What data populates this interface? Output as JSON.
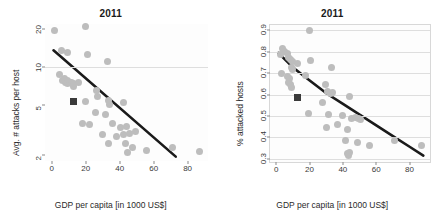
{
  "figure": {
    "panels": [
      {
        "name": "avg-attacks-per-host",
        "title": "2011",
        "xlabel": "GDP per capita [in 1000 US$]",
        "ylabel": "Avg. # attacks per host",
        "xticks": [
          "0",
          "20",
          "40",
          "60",
          "80"
        ],
        "yticks": [
          "2",
          "5",
          "10",
          "20"
        ]
      },
      {
        "name": "percent-attacked-hosts",
        "title": "2011",
        "xlabel": "GDP per capita [in 1000 US$]",
        "ylabel": "% attacked hosts",
        "xticks": [
          "0",
          "20",
          "40",
          "60",
          "80"
        ],
        "yticks": [
          "0.3",
          "0.4",
          "0.5",
          "0.6",
          "0.7",
          "0.8",
          "0.9"
        ]
      }
    ],
    "colors": {
      "point": "#bdbdbd",
      "highlight_marker": "#3a3a3a",
      "trend_line": "#1a1a1a",
      "gridline": "#dedede",
      "frame": "#d8d8d8",
      "background": "#ffffff"
    }
  },
  "chart_data": [
    {
      "type": "scatter",
      "title": "2011",
      "xlabel": "GDP per capita [in 1000 US$]",
      "ylabel": "Avg. # attacks per host",
      "xlim": [
        -4,
        92
      ],
      "ylim": [
        1.8,
        22
      ],
      "yscale": "log",
      "xscale": "linear",
      "xticks": [
        0,
        20,
        40,
        60,
        80
      ],
      "yticks": [
        2,
        5,
        10,
        20
      ],
      "grid": "horizontal-at-10",
      "gridlines_y": [
        10
      ],
      "legend": "none",
      "series": [
        {
          "name": "countries",
          "marker": "circle",
          "color": "#bdbdbd",
          "points": [
            [
              1.5,
              19.6
            ],
            [
              6.0,
              13.5
            ],
            [
              9.0,
              13.0
            ],
            [
              20.0,
              21.0
            ],
            [
              21.0,
              12.6
            ],
            [
              33.0,
              11.0
            ],
            [
              4.5,
              8.8
            ],
            [
              6.5,
              7.8
            ],
            [
              7.5,
              8.2
            ],
            [
              8.0,
              7.6
            ],
            [
              9.0,
              7.9
            ],
            [
              9.5,
              7.4
            ],
            [
              10.5,
              7.6
            ],
            [
              11.5,
              7.5
            ],
            [
              12.5,
              7.4
            ],
            [
              13.0,
              7.0
            ],
            [
              15.5,
              7.5
            ],
            [
              26.5,
              6.5
            ],
            [
              27.0,
              5.9
            ],
            [
              20.0,
              5.3
            ],
            [
              33.5,
              5.4
            ],
            [
              34.0,
              5.1
            ],
            [
              42.0,
              5.2
            ],
            [
              25.5,
              4.4
            ],
            [
              31.5,
              4.2
            ],
            [
              18.0,
              3.6
            ],
            [
              22.0,
              3.5
            ],
            [
              36.0,
              3.6
            ],
            [
              40.5,
              3.3
            ],
            [
              44.0,
              3.4
            ],
            [
              30.0,
              2.9
            ],
            [
              38.0,
              2.8
            ],
            [
              42.5,
              2.9
            ],
            [
              45.5,
              3.0
            ],
            [
              49.5,
              3.1
            ],
            [
              33.5,
              2.5
            ],
            [
              43.5,
              2.5
            ],
            [
              44.5,
              2.1
            ],
            [
              47.5,
              2.3
            ],
            [
              56.0,
              2.2
            ],
            [
              71.0,
              2.3
            ],
            [
              87.0,
              2.15
            ]
          ]
        },
        {
          "name": "highlighted-country",
          "marker": "filled-square",
          "color": "#3a3a3a",
          "points": [
            [
              13.0,
              5.3
            ]
          ]
        },
        {
          "name": "trend-line",
          "marker": "line",
          "color": "#1a1a1a",
          "points": [
            [
              1.0,
              13.6
            ],
            [
              73.0,
              1.95
            ]
          ]
        }
      ]
    },
    {
      "type": "scatter",
      "title": "2011",
      "xlabel": "GDP per capita [in 1000 US$]",
      "ylabel": "% attacked hosts",
      "xlim": [
        -4,
        92
      ],
      "ylim": [
        0.285,
        0.925
      ],
      "yscale": "linear",
      "xscale": "linear",
      "xticks": [
        0,
        20,
        40,
        60,
        80
      ],
      "yticks": [
        0.3,
        0.4,
        0.5,
        0.6,
        0.7,
        0.8,
        0.9
      ],
      "grid": "horizontal",
      "gridlines_y": [
        0.3,
        0.4,
        0.5,
        0.6,
        0.7,
        0.8,
        0.9
      ],
      "legend": "none",
      "series": [
        {
          "name": "countries",
          "marker": "circle",
          "color": "#bdbdbd",
          "points": [
            [
              20.0,
              0.9
            ],
            [
              4.0,
              0.815
            ],
            [
              5.0,
              0.8
            ],
            [
              2.5,
              0.785
            ],
            [
              6.5,
              0.79
            ],
            [
              7.5,
              0.775
            ],
            [
              8.5,
              0.765
            ],
            [
              9.5,
              0.755
            ],
            [
              20.5,
              0.76
            ],
            [
              3.0,
              0.7
            ],
            [
              9.0,
              0.725
            ],
            [
              10.0,
              0.715
            ],
            [
              13.0,
              0.745
            ],
            [
              33.0,
              0.725
            ],
            [
              7.0,
              0.685
            ],
            [
              8.0,
              0.675
            ],
            [
              17.5,
              0.69
            ],
            [
              7.5,
              0.655
            ],
            [
              8.5,
              0.645
            ],
            [
              9.0,
              0.635
            ],
            [
              29.5,
              0.645
            ],
            [
              31.0,
              0.615
            ],
            [
              32.5,
              0.605
            ],
            [
              34.0,
              0.61
            ],
            [
              44.0,
              0.59
            ],
            [
              27.5,
              0.565
            ],
            [
              19.5,
              0.51
            ],
            [
              31.5,
              0.505
            ],
            [
              39.5,
              0.5
            ],
            [
              45.0,
              0.49
            ],
            [
              47.5,
              0.495
            ],
            [
              49.5,
              0.49
            ],
            [
              50.5,
              0.485
            ],
            [
              37.0,
              0.46
            ],
            [
              42.5,
              0.435
            ],
            [
              30.0,
              0.445
            ],
            [
              41.5,
              0.385
            ],
            [
              49.0,
              0.375
            ],
            [
              56.0,
              0.36
            ],
            [
              71.0,
              0.385
            ],
            [
              87.0,
              0.36
            ],
            [
              43.0,
              0.325
            ],
            [
              44.0,
              0.33
            ],
            [
              43.5,
              0.315
            ]
          ]
        },
        {
          "name": "highlighted-country",
          "marker": "filled-square",
          "color": "#3a3a3a",
          "points": [
            [
              13.0,
              0.585
            ]
          ]
        },
        {
          "name": "trend-line",
          "marker": "curve",
          "color": "#1a1a1a",
          "points": [
            [
              1.0,
              0.795
            ],
            [
              10.0,
              0.725
            ],
            [
              20.0,
              0.665
            ],
            [
              30.0,
              0.605
            ],
            [
              40.0,
              0.555
            ],
            [
              50.0,
              0.505
            ],
            [
              60.0,
              0.455
            ],
            [
              70.0,
              0.405
            ],
            [
              80.0,
              0.355
            ],
            [
              88.0,
              0.315
            ]
          ]
        }
      ]
    }
  ]
}
